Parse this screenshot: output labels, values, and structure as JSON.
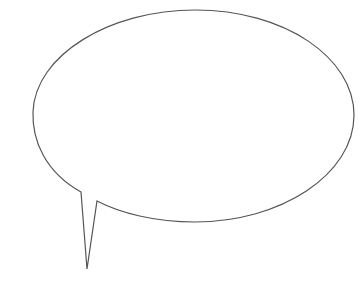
{
  "bubble": {
    "shape": "speech-bubble",
    "fill": "#ffffff",
    "stroke": "#555555",
    "text": ""
  }
}
